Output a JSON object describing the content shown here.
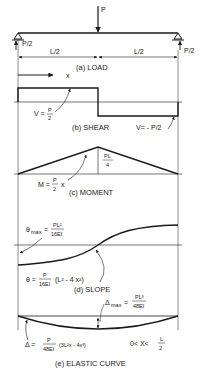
{
  "colors": {
    "ink": "#1a1a1a",
    "background": "#ffffff"
  },
  "load": {
    "force_label": "P",
    "left_reaction": "P/2",
    "right_reaction": "P/2",
    "left_span": "L/2",
    "right_span": "L/2",
    "x_axis_label": "x",
    "caption": "(a) LOAD"
  },
  "shear": {
    "left_label_prefix": "V =",
    "left_label_num": "P",
    "left_label_den": "2",
    "right_label": "V= - P/2",
    "caption": "(b) SHEAR"
  },
  "moment": {
    "peak_num": "PL",
    "peak_den": "4",
    "eq_prefix": "M =",
    "eq_num": "P",
    "eq_den": "2",
    "eq_suffix": "x",
    "caption": "(c) MOMENT"
  },
  "slope": {
    "max_prefix": "θ",
    "max_sub": "max",
    "max_eq": "=",
    "max_num": "PL²",
    "max_den": "16EI",
    "eq_prefix": "θ =",
    "eq_num": "P",
    "eq_den": "16EI",
    "eq_suffix": "(L² - 4 x²)",
    "caption": "(d) SLOPE"
  },
  "elastic": {
    "max_prefix": "Δ",
    "max_sub": "max",
    "max_eq": "=",
    "max_num": "PL³",
    "max_den": "48EI",
    "eq_prefix": "Δ =",
    "eq_num": "P",
    "eq_den": "48EI",
    "eq_suffix": "(3L²x - 4x³)",
    "range_prefix": "0< X<",
    "range_num": "L",
    "range_den": "2",
    "caption": "(e) ELASTIC CURVE"
  }
}
